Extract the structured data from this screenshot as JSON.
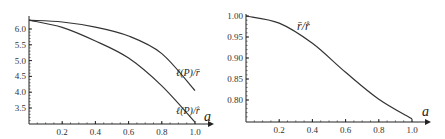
{
  "chart_data": [
    {
      "type": "line",
      "title": "",
      "xlabel": "a",
      "ylabel": "",
      "xlim": [
        0,
        1.05
      ],
      "ylim": [
        3.0,
        6.35
      ],
      "x_ticks": [
        "0.2",
        "0.4",
        "0.6",
        "0.8",
        "1.0"
      ],
      "y_ticks": [
        "3.5",
        "4.0",
        "4.5",
        "5.0",
        "5.5",
        "6.0"
      ],
      "grid": false,
      "x": [
        0.0,
        0.2,
        0.4,
        0.6,
        0.8,
        1.0
      ],
      "series": [
        {
          "name": "ℓ(P)/r̄",
          "values": [
            6.28,
            6.22,
            6.06,
            5.78,
            5.22,
            4.05
          ]
        },
        {
          "name": "ℓ(P)/r̊",
          "values": [
            6.28,
            6.05,
            5.62,
            5.08,
            4.2,
            3.05
          ]
        }
      ]
    },
    {
      "type": "line",
      "title": "",
      "xlabel": "a",
      "ylabel": "",
      "xlim": [
        0,
        1.05
      ],
      "ylim": [
        0.75,
        1.0
      ],
      "x_ticks": [
        "0.2",
        "0.4",
        "0.6",
        "0.8",
        "1.0"
      ],
      "y_ticks": [
        "0.80",
        "0.85",
        "0.90",
        "0.95",
        "1.00"
      ],
      "grid": false,
      "x": [
        0.0,
        0.2,
        0.4,
        0.6,
        0.8,
        1.0
      ],
      "series": [
        {
          "name": "r̄/r̊",
          "values": [
            1.0,
            0.983,
            0.935,
            0.866,
            0.802,
            0.755
          ]
        }
      ]
    }
  ],
  "left": {
    "x_axis_label": "a",
    "x_ticks": [
      "0.2",
      "0.4",
      "0.6",
      "0.8",
      "1.0"
    ],
    "y_ticks": [
      "3.5",
      "4.0",
      "4.5",
      "5.0",
      "5.5",
      "6.0"
    ],
    "curve_upper_label": "ℓ(P)/r̄",
    "curve_lower_label": "ℓ(P)/r̊"
  },
  "right": {
    "x_axis_label": "a",
    "x_ticks": [
      "0.2",
      "0.4",
      "0.6",
      "0.8",
      "1.0"
    ],
    "y_ticks": [
      "0.80",
      "0.85",
      "0.90",
      "0.95",
      "1.00"
    ],
    "curve_label": "r̄/r̊"
  }
}
